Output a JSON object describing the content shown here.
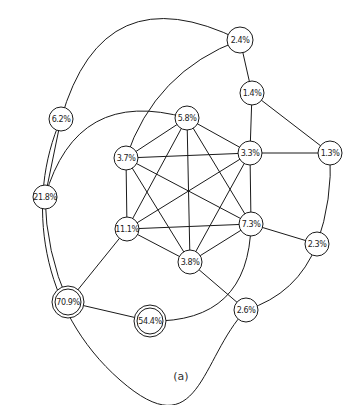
{
  "diagram": {
    "caption": "(a)",
    "nodes": [
      {
        "id": "n24",
        "label": "2.4%",
        "x": 240,
        "y": 40,
        "r": 13,
        "double": false
      },
      {
        "id": "n14",
        "label": "1.4%",
        "x": 252,
        "y": 93,
        "r": 12,
        "double": false
      },
      {
        "id": "n62",
        "label": "6.2%",
        "x": 61,
        "y": 119,
        "r": 12,
        "double": false
      },
      {
        "id": "n58",
        "label": "5.8%",
        "x": 187,
        "y": 118,
        "r": 12,
        "double": false
      },
      {
        "id": "n37",
        "label": "3.7%",
        "x": 126,
        "y": 158,
        "r": 12,
        "double": false
      },
      {
        "id": "n33",
        "label": "3.3%",
        "x": 250,
        "y": 153,
        "r": 12,
        "double": false
      },
      {
        "id": "n13",
        "label": "1.3%",
        "x": 330,
        "y": 153,
        "r": 12,
        "double": false
      },
      {
        "id": "n218",
        "label": "21.8%",
        "x": 45,
        "y": 197,
        "r": 12,
        "double": false
      },
      {
        "id": "n111",
        "label": "11.1%",
        "x": 127,
        "y": 229,
        "r": 12,
        "double": false
      },
      {
        "id": "n73",
        "label": "7.3%",
        "x": 251,
        "y": 224,
        "r": 12,
        "double": false
      },
      {
        "id": "n38",
        "label": "3.8%",
        "x": 190,
        "y": 262,
        "r": 12,
        "double": false
      },
      {
        "id": "n23",
        "label": "2.3%",
        "x": 317,
        "y": 244,
        "r": 12,
        "double": false
      },
      {
        "id": "n26",
        "label": "2.6%",
        "x": 246,
        "y": 310,
        "r": 12,
        "double": false
      },
      {
        "id": "n709",
        "label": "70.9%",
        "x": 68,
        "y": 302,
        "r": 13,
        "double": true
      },
      {
        "id": "n544",
        "label": "54.4%",
        "x": 150,
        "y": 321,
        "r": 13,
        "double": true
      }
    ],
    "edges": [
      {
        "from": "n58",
        "to": "n37",
        "curve": 0
      },
      {
        "from": "n58",
        "to": "n33",
        "curve": 0
      },
      {
        "from": "n58",
        "to": "n111",
        "curve": 0
      },
      {
        "from": "n58",
        "to": "n73",
        "curve": 0
      },
      {
        "from": "n58",
        "to": "n38",
        "curve": 0
      },
      {
        "from": "n37",
        "to": "n33",
        "curve": 0
      },
      {
        "from": "n37",
        "to": "n111",
        "curve": 0
      },
      {
        "from": "n37",
        "to": "n73",
        "curve": 0
      },
      {
        "from": "n37",
        "to": "n38",
        "curve": 0
      },
      {
        "from": "n33",
        "to": "n111",
        "curve": 0
      },
      {
        "from": "n33",
        "to": "n73",
        "curve": 0
      },
      {
        "from": "n33",
        "to": "n38",
        "curve": 0
      },
      {
        "from": "n111",
        "to": "n73",
        "curve": 0
      },
      {
        "from": "n111",
        "to": "n38",
        "curve": 0
      },
      {
        "from": "n73",
        "to": "n38",
        "curve": 0
      },
      {
        "from": "n24",
        "to": "n14",
        "curve": 0
      },
      {
        "from": "n24",
        "to": "n37",
        "curve": 0.12
      },
      {
        "from": "n24",
        "to": "n62",
        "curve": 0.3
      },
      {
        "from": "n14",
        "to": "n33",
        "curve": 0
      },
      {
        "from": "n14",
        "to": "n13",
        "curve": 0
      },
      {
        "from": "n33",
        "to": "n13",
        "curve": 0
      },
      {
        "from": "n13",
        "to": "n23",
        "curve": -0.05
      },
      {
        "from": "n73",
        "to": "n23",
        "curve": 0
      },
      {
        "from": "n23",
        "to": "n26",
        "curve": -0.12
      },
      {
        "from": "n38",
        "to": "n26",
        "curve": 0
      },
      {
        "from": "n62",
        "to": "n218",
        "curve": 0
      },
      {
        "from": "n58",
        "to": "n218",
        "curve": 0.25
      },
      {
        "from": "n218",
        "to": "n709",
        "curve": 0.05
      },
      {
        "from": "n111",
        "to": "n709",
        "curve": 0
      },
      {
        "from": "n709",
        "to": "n544",
        "curve": 0
      },
      {
        "from": "n73",
        "to": "n544",
        "curve": -0.25
      }
    ],
    "outer_arc": {
      "from": "n62",
      "to": "n26",
      "via": [
        [
          25,
          200
        ],
        [
          40,
          310
        ],
        [
          120,
          380
        ],
        [
          200,
          358
        ]
      ]
    }
  }
}
